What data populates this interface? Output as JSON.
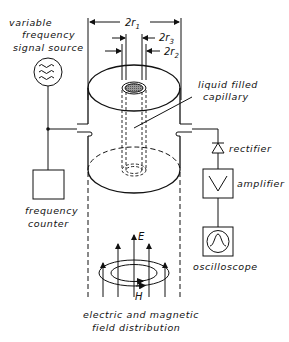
{
  "diagram": {
    "labels": {
      "source": [
        "variable",
        "frequency",
        "signal source"
      ],
      "capillary": [
        "liquid filled",
        "capillary"
      ],
      "rectifier": "rectifier",
      "amplifier": "amplifier",
      "oscilloscope": "oscilloscope",
      "counter": [
        "frequency",
        "counter"
      ],
      "field": [
        "electric and magnetic",
        "field distribution"
      ],
      "e_field": "E",
      "h_field": "H"
    },
    "dimensions": {
      "outer": {
        "base": "2r",
        "sub": "1"
      },
      "inner3": {
        "base": "2r",
        "sub": "3"
      },
      "inner2": {
        "base": "2r",
        "sub": "2"
      }
    },
    "icons": {
      "source": "sine-wave-generator-icon",
      "amplifier": "triangle-amplifier-icon",
      "oscilloscope": "gaussian-pulse-icon",
      "rectifier": "diode-icon"
    }
  }
}
